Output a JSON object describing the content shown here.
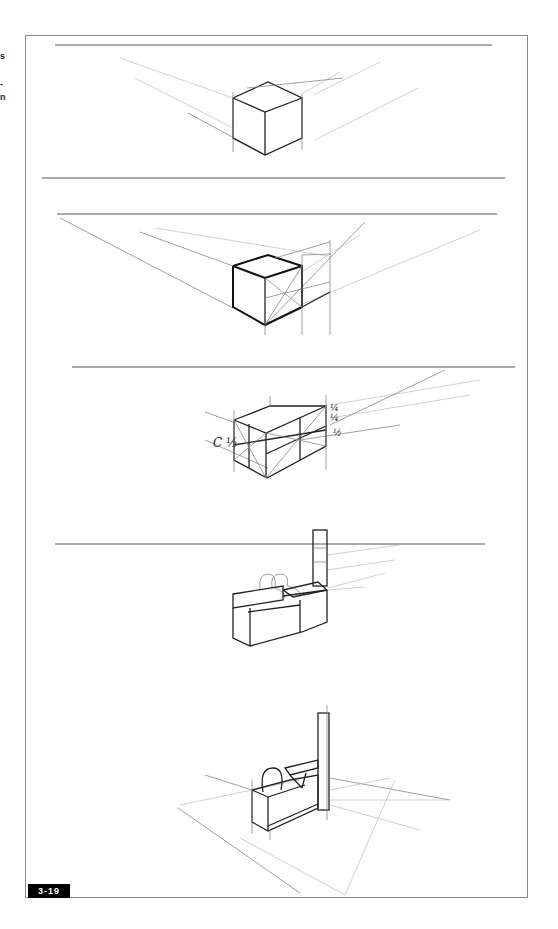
{
  "page": {
    "margin_text_fragments": [
      "s",
      "-",
      "n"
    ],
    "figure_number": "3-19"
  },
  "figure": {
    "type": "perspective sketch sequence",
    "steps": [
      {
        "id": 1,
        "description": "Cube in two-point perspective below horizon line"
      },
      {
        "id": 2,
        "description": "Cube with diagonal construction used to repeat depth"
      },
      {
        "id": 3,
        "description": "Extended box divided into proportional segments",
        "labels": [
          "¼",
          "¼",
          "½",
          "C ½"
        ]
      },
      {
        "id": 4,
        "description": "Reception counter with figures and column"
      },
      {
        "id": 5,
        "description": "Finished counter with figure, column and floor grid"
      }
    ]
  }
}
